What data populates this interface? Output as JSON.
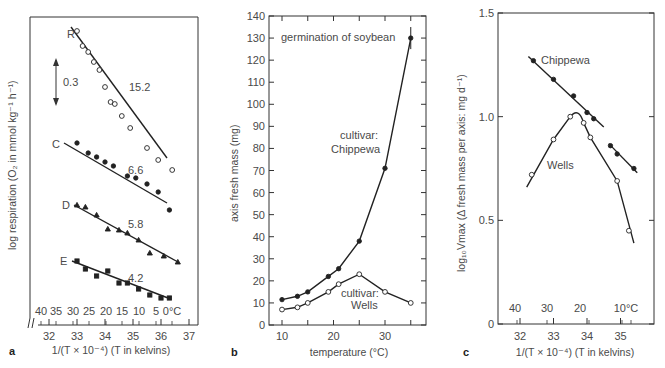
{
  "chart_data": [
    {
      "panel": "a",
      "type": "scatter",
      "title": "",
      "xlabel": "1/(T × 10^-4) (T in kelvins)",
      "ylabel": "log respiration (O2 in mmol kg^-1 h^-1)",
      "xlim": [
        31.5,
        37.3
      ],
      "x_ticks": [
        32,
        33,
        34,
        35,
        36,
        37
      ],
      "celsius_ticks": [
        "40",
        "35",
        "30",
        "25",
        "20",
        "15",
        "10",
        "5",
        "0°C"
      ],
      "scale_bar_label": "0.3",
      "grid": false,
      "series": [
        {
          "name": "R",
          "marker": "open-circle",
          "slope_label": "15.2",
          "x": [
            33.0,
            33.2,
            33.4,
            33.6,
            33.8,
            34.0,
            34.2,
            34.35,
            34.6,
            34.9,
            35.5,
            35.9,
            36.4
          ],
          "y_px": [
            31,
            46,
            52,
            62,
            70,
            87,
            102,
            104,
            116,
            128,
            148,
            160,
            170
          ],
          "fit_px": [
            [
              71,
              27
            ],
            [
              167,
              158
            ]
          ]
        },
        {
          "name": "C",
          "marker": "filled-circle",
          "slope_label": "6.6",
          "x": [
            33.0,
            33.4,
            33.7,
            34.0,
            34.3,
            34.8,
            35.1,
            35.5,
            35.9,
            36.3
          ],
          "y_px": [
            143,
            153,
            157,
            162,
            166,
            176,
            178,
            184,
            192,
            210
          ],
          "fit_px": [
            [
              64,
              143
            ],
            [
              167,
              203
            ]
          ]
        },
        {
          "name": "D",
          "marker": "filled-triangle",
          "slope_label": "5.8",
          "x": [
            33.0,
            33.3,
            33.7,
            34.1,
            34.5,
            34.8,
            35.2,
            35.6,
            36.1,
            36.6
          ],
          "y_px": [
            205,
            207,
            215,
            229,
            230,
            233,
            240,
            253,
            256,
            262
          ],
          "fit_px": [
            [
              74,
              205
            ],
            [
              178,
              262
            ]
          ]
        },
        {
          "name": "E",
          "marker": "filled-square",
          "slope_label": "4.2",
          "x": [
            33.0,
            33.3,
            33.7,
            34.1,
            34.5,
            34.8,
            35.2,
            35.6,
            36.0,
            36.3
          ],
          "y_px": [
            261,
            269,
            276,
            271,
            283,
            283,
            289,
            295,
            298,
            298
          ],
          "fit_px": [
            [
              72,
              261
            ],
            [
              168,
              298
            ]
          ]
        }
      ]
    },
    {
      "panel": "b",
      "type": "line",
      "title": "germination of soybean",
      "xlabel": "temperature (°C)",
      "ylabel": "axis fresh mass (mg)",
      "xlim": [
        7.5,
        38
      ],
      "ylim": [
        0,
        140
      ],
      "x_ticks": [
        10,
        20,
        30
      ],
      "y_ticks": [
        0,
        10,
        20,
        30,
        40,
        50,
        60,
        70,
        80,
        90,
        100,
        110,
        120,
        130,
        140
      ],
      "grid": false,
      "series": [
        {
          "name": "cultivar: Chippewa",
          "marker": "filled-circle",
          "x": [
            10,
            13,
            15,
            19,
            21,
            25,
            30,
            35
          ],
          "y": [
            11.5,
            13,
            15,
            22,
            25.5,
            38,
            71,
            130
          ]
        },
        {
          "name": "cultivar: Wells",
          "marker": "open-circle",
          "x": [
            10,
            13,
            15,
            19,
            21,
            25,
            30,
            35
          ],
          "y": [
            7,
            8,
            10,
            15,
            18.5,
            23,
            15,
            10
          ]
        }
      ]
    },
    {
      "panel": "c",
      "type": "line",
      "title": "",
      "xlabel": "1/(T × 10^-4) (T in kelvins)",
      "ylabel": "log10 Vmax (Δ fresh mass per axis: mg d^-1)",
      "xlim": [
        31.4,
        36.2
      ],
      "ylim": [
        0,
        1.5
      ],
      "x_ticks": [
        32,
        33,
        34,
        35
      ],
      "y_ticks": [
        0,
        0.5,
        1.0,
        1.5
      ],
      "celsius_ticks": [
        "40",
        "30",
        "20",
        "10°C"
      ],
      "grid": false,
      "series": [
        {
          "name": "Chippewa",
          "marker": "filled-circle",
          "x": [
            32.4,
            33.0,
            33.6,
            34.0,
            34.2,
            34.7,
            34.9,
            35.4
          ],
          "y": [
            1.27,
            1.18,
            1.1,
            1.02,
            0.99,
            0.86,
            0.82,
            0.75
          ],
          "segments": [
            [
              0,
              4
            ],
            [
              5,
              7
            ]
          ]
        },
        {
          "name": "Wells",
          "marker": "open-circle",
          "x": [
            32.35,
            33.0,
            33.5,
            33.9,
            34.1,
            34.9,
            35.25
          ],
          "y": [
            0.72,
            0.89,
            1.0,
            0.97,
            0.9,
            0.69,
            0.45
          ]
        }
      ]
    }
  ],
  "panels": {
    "a": {
      "letter": "a",
      "ylabel": "log respiration (O₂ in mmol kg⁻¹ h⁻¹)",
      "xlabel": "1/(T × 10⁻⁴) (T in kelvins)",
      "scale_bar": "0.3",
      "series_labels": [
        "R",
        "C",
        "D",
        "E"
      ],
      "slope_labels": [
        "15.2",
        "6.6",
        "5.8",
        "4.2"
      ],
      "celsius": [
        "40",
        "35",
        "30",
        "25",
        "20",
        "15",
        "10",
        "5",
        "0°C"
      ],
      "xticks": [
        "32",
        "33",
        "34",
        "35",
        "36",
        "37"
      ]
    },
    "b": {
      "letter": "b",
      "title": "germination of soybean",
      "ylabel": "axis fresh mass (mg)",
      "xlabel": "temperature (°C)",
      "label_chippewa_1": "cultivar:",
      "label_chippewa_2": "Chippewa",
      "label_wells_1": "cultivar:",
      "label_wells_2": "Wells",
      "yticks": [
        "0",
        "10",
        "20",
        "30",
        "40",
        "50",
        "60",
        "70",
        "80",
        "90",
        "100",
        "110",
        "120",
        "130",
        "140"
      ],
      "xticks": [
        "10",
        "20",
        "30"
      ]
    },
    "c": {
      "letter": "c",
      "ylabel": "log₁₀Vmax (Δ fresh mass per axis: mg d⁻¹)",
      "xlabel": "1/(T × 10⁻⁴) (T in kelvins)",
      "label_chippewa": "Chippewa",
      "label_wells": "Wells",
      "yticks": [
        "0",
        "0.5",
        "1.0",
        "1.5"
      ],
      "xticks": [
        "32",
        "33",
        "34",
        "35"
      ],
      "celsius": [
        "40",
        "30",
        "20",
        "10°C"
      ]
    }
  }
}
